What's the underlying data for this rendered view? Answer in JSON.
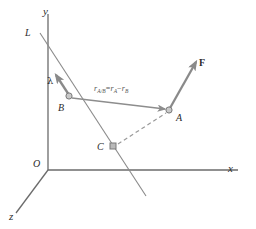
{
  "figure": {
    "background_color": "#ffffff",
    "axis_color": "#6b6b6b",
    "line_color": "#8a8a8a",
    "vector_color": "#7a7a7a",
    "dashed_color": "#9a9a9a",
    "text_color": "#2b2b2b",
    "axes": [
      {
        "name": "y-axis",
        "label": "y",
        "direction": "up"
      },
      {
        "name": "x-axis",
        "label": "x",
        "direction": "right"
      },
      {
        "name": "z-axis",
        "label": "z",
        "direction": "down-left"
      }
    ],
    "origin": {
      "label": "O"
    },
    "line": {
      "label": "L",
      "description": "line through points B and C"
    },
    "points": [
      {
        "label": "B",
        "marker": "circle",
        "x": 69,
        "y": 96
      },
      {
        "label": "A",
        "marker": "circle",
        "x": 169,
        "y": 110
      },
      {
        "label": "C",
        "marker": "square",
        "x": 113,
        "y": 146
      }
    ],
    "vectors": [
      {
        "name": "unit-vector-lambda",
        "label": "λ",
        "from": "B",
        "direction": "along line L"
      },
      {
        "name": "force-vector",
        "label": "F",
        "from": "A",
        "direction": "up-right"
      },
      {
        "name": "relative-position-vector",
        "from": "B",
        "to": "A"
      }
    ],
    "equation": {
      "lhs_symbol": "r",
      "lhs_subscript": "A/B",
      "equals": "=",
      "term1_symbol": "r",
      "term1_subscript": "A",
      "minus": "−",
      "term2_symbol": "r",
      "term2_subscript": "B",
      "plain": "r_A/B = r_A − r_B"
    },
    "dashed_segment": {
      "from": "C",
      "to": "A"
    }
  }
}
